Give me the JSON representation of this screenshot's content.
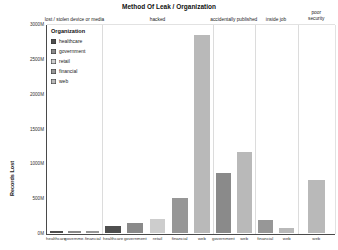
{
  "title": "Method Of Leak / Organization",
  "y_axis": {
    "label": "Records Lost",
    "ticks": [
      "0M",
      "500M",
      "1000M",
      "1500M",
      "2000M",
      "2500M",
      "3000M"
    ],
    "max_value": 3000
  },
  "legend": {
    "title": "Organization",
    "items": [
      {
        "label": "healthcare",
        "color": "#4f4f4f"
      },
      {
        "label": "government",
        "color": "#8a8a8a"
      },
      {
        "label": "retail",
        "color": "#cdcdcd"
      },
      {
        "label": "financial",
        "color": "#979797"
      },
      {
        "label": "web",
        "color": "#b9b9b9"
      }
    ]
  },
  "chart_data": {
    "type": "bar",
    "title": "Method Of Leak / Organization",
    "xlabel": "",
    "ylabel": "Records Lost",
    "ylim": [
      0,
      3000
    ],
    "grid": false,
    "legend_position": "inside upper-left",
    "facets": [
      {
        "label": "lost / stolen device or media",
        "wrap": false,
        "bars": [
          {
            "org": "healthcare",
            "label": "healthcare",
            "value": 40
          },
          {
            "org": "government",
            "label": "governme.",
            "value": 40
          },
          {
            "org": "financial",
            "label": "financial",
            "value": 30
          }
        ]
      },
      {
        "label": "hacked",
        "wrap": false,
        "bars": [
          {
            "org": "healthcare",
            "label": "healthcare",
            "value": 110
          },
          {
            "org": "government",
            "label": "government",
            "value": 150
          },
          {
            "org": "retail",
            "label": "retail",
            "value": 205
          },
          {
            "org": "financial",
            "label": "financial",
            "value": 515
          },
          {
            "org": "web",
            "label": "web",
            "value": 2860
          }
        ]
      },
      {
        "label": "accidentally published",
        "wrap": false,
        "bars": [
          {
            "org": "government",
            "label": "government",
            "value": 865
          },
          {
            "org": "web",
            "label": "web",
            "value": 1170
          }
        ]
      },
      {
        "label": "inside job",
        "wrap": false,
        "bars": [
          {
            "org": "financial",
            "label": "financial",
            "value": 195
          },
          {
            "org": "web",
            "label": "web",
            "value": 75
          }
        ]
      },
      {
        "label": "poor security",
        "wrap": true,
        "bars": [
          {
            "org": "web",
            "label": "web",
            "value": 770
          }
        ]
      }
    ]
  }
}
